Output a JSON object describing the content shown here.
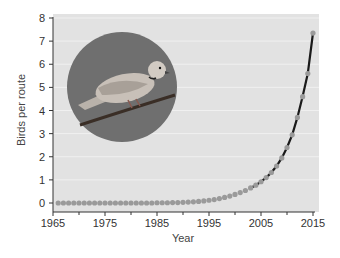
{
  "chart_data": {
    "type": "line",
    "title": "",
    "xlabel": "Year",
    "ylabel": "Birds per route",
    "xlim": [
      1965,
      2015
    ],
    "ylim": [
      0,
      8
    ],
    "x_ticks": [
      1965,
      1975,
      1985,
      1995,
      2005,
      2015
    ],
    "x_minor_ticks": [
      1970,
      1980,
      1990,
      2000,
      2010
    ],
    "y_ticks": [
      0,
      1,
      2,
      3,
      4,
      5,
      6,
      7,
      8
    ],
    "grid": "horizontal, faint white",
    "legend": "none",
    "annotation": "circular photo of a Eurasian collared dove perched on a branch",
    "series": [
      {
        "name": "Birds per route",
        "x": [
          1966,
          1967,
          1968,
          1969,
          1970,
          1971,
          1972,
          1973,
          1974,
          1975,
          1976,
          1977,
          1978,
          1979,
          1980,
          1981,
          1982,
          1983,
          1984,
          1985,
          1986,
          1987,
          1988,
          1989,
          1990,
          1991,
          1992,
          1993,
          1994,
          1995,
          1996,
          1997,
          1998,
          1999,
          2000,
          2001,
          2002,
          2003,
          2004,
          2005,
          2006,
          2007,
          2008,
          2009,
          2010,
          2011,
          2012,
          2013,
          2014,
          2015
        ],
        "values": [
          0,
          0,
          0,
          0,
          0,
          0,
          0,
          0,
          0,
          0,
          0,
          0,
          0,
          0,
          0,
          0,
          0,
          0,
          0,
          0.01,
          0.01,
          0.01,
          0.02,
          0.02,
          0.03,
          0.04,
          0.05,
          0.07,
          0.09,
          0.12,
          0.15,
          0.19,
          0.24,
          0.3,
          0.37,
          0.45,
          0.54,
          0.65,
          0.77,
          0.92,
          1.1,
          1.32,
          1.6,
          1.95,
          2.4,
          2.95,
          3.7,
          4.6,
          5.6,
          7.35
        ]
      }
    ]
  },
  "colors": {
    "plot_background": "#e2e2e2",
    "gridline": "#f0f0f0",
    "marker": "#9a9a9a",
    "line": "#1a1a1a",
    "photo_background": "#6f6f6f",
    "axis": "#333333"
  },
  "photo": {
    "subject": "collared dove on branch",
    "shape": "circle"
  }
}
